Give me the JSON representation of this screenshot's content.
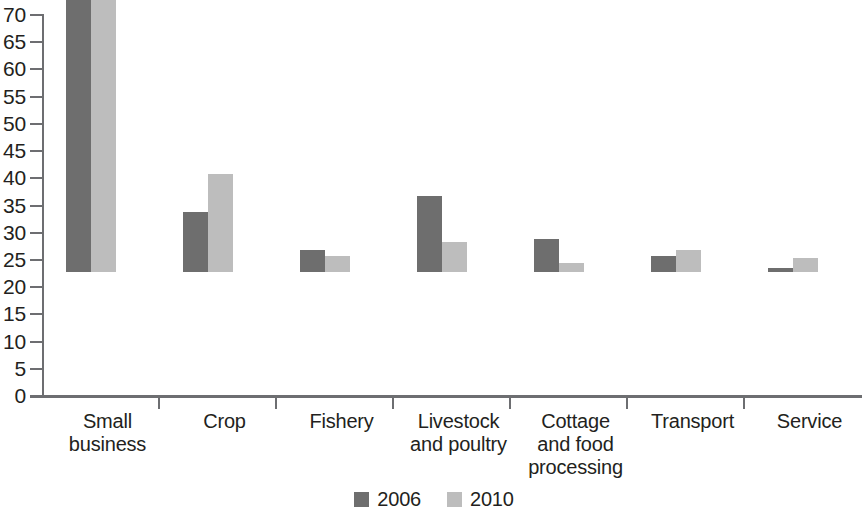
{
  "chart_data": {
    "type": "bar",
    "title": "",
    "subtitle": "",
    "xlabel": "",
    "ylabel": "",
    "ylim": [
      0,
      70
    ],
    "y_ticks": [
      0,
      5,
      10,
      15,
      20,
      25,
      30,
      35,
      40,
      45,
      50,
      55,
      60,
      65,
      70
    ],
    "grid": false,
    "legend_position": "bottom-center",
    "categories": [
      "Small business",
      "Crop",
      "Fishery",
      "Livestock and poultry",
      "Cottage and food processing",
      "Transport",
      "Service"
    ],
    "category_label_lines": [
      [
        "Small",
        "business"
      ],
      [
        "Crop"
      ],
      [
        "Fishery"
      ],
      [
        "Livestock",
        "and poultry"
      ],
      [
        "Cottage",
        "and food",
        "processing"
      ],
      [
        "Transport"
      ],
      [
        "Service"
      ]
    ],
    "series": [
      {
        "name": "2006",
        "color": "#6e6e6e",
        "values": [
          61,
          11,
          4,
          14,
          6,
          3,
          0.7
        ]
      },
      {
        "name": "2010",
        "color": "#bdbdbd",
        "values": [
          64,
          18,
          3,
          5.5,
          1.7,
          4,
          2.5
        ]
      }
    ]
  },
  "legend": {
    "items": [
      {
        "label": "2006",
        "color": "#6e6e6e"
      },
      {
        "label": "2010",
        "color": "#bdbdbd"
      }
    ]
  },
  "colors": {
    "series_2006": "#6e6e6e",
    "series_2010": "#bdbdbd",
    "axis": "#6d6e71",
    "text": "#231f20",
    "background": "#ffffff"
  }
}
